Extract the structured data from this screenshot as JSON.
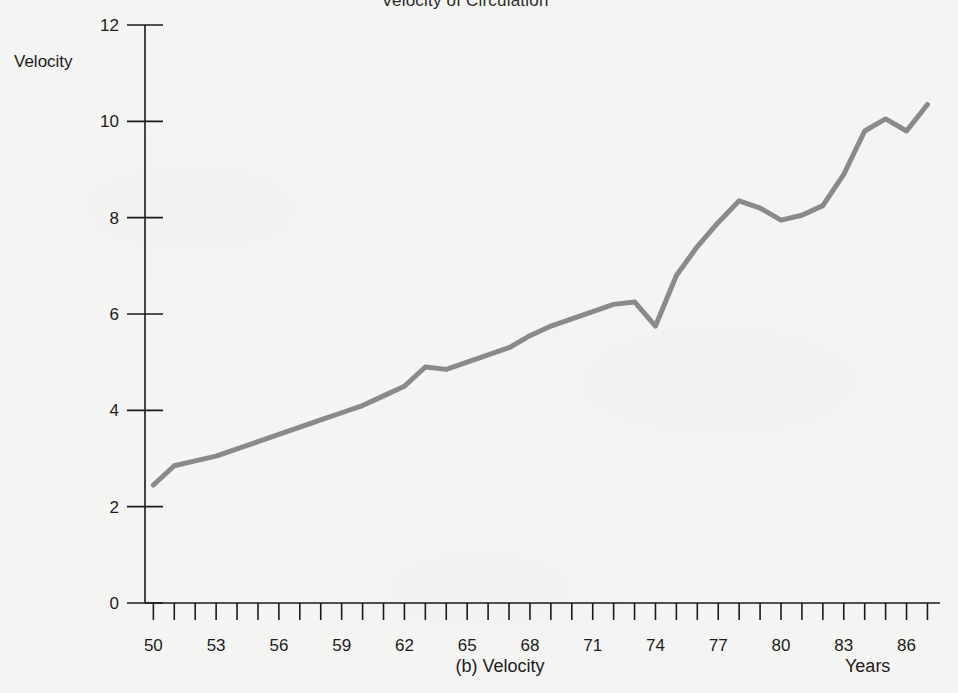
{
  "page": {
    "background_color": "#f4f4f2",
    "title": "Velocity of Circulation",
    "caption": "(b) Velocity",
    "y_axis_title": "Velocity",
    "x_axis_title": "Years"
  },
  "chart_data": {
    "type": "line",
    "title": "Velocity of Circulation",
    "subtitle": "(b) Velocity",
    "xlabel": "Years",
    "ylabel": "Velocity",
    "xlim": [
      49.6,
      87.6
    ],
    "ylim": [
      0,
      12
    ],
    "yticks": [
      0,
      2,
      4,
      6,
      8,
      10,
      12
    ],
    "ytick_labels": [
      "0",
      "2",
      "4",
      "6",
      "8",
      "10",
      "12"
    ],
    "xticks": [
      50,
      51,
      52,
      53,
      54,
      55,
      56,
      57,
      58,
      59,
      60,
      61,
      62,
      63,
      64,
      65,
      66,
      67,
      68,
      69,
      70,
      71,
      72,
      73,
      74,
      75,
      76,
      77,
      78,
      79,
      80,
      81,
      82,
      83,
      84,
      85,
      86,
      87
    ],
    "xtick_labels_shown": [
      "50",
      "53",
      "56",
      "59",
      "62",
      "65",
      "68",
      "71",
      "74",
      "77",
      "80",
      "83",
      "86"
    ],
    "xtick_label_interval": 3,
    "grid": false,
    "legend": null,
    "series": [
      {
        "name": "Velocity of circulation",
        "color": "#8a8a8a",
        "line_width": 5,
        "x": [
          50,
          51,
          52,
          53,
          54,
          55,
          56,
          57,
          58,
          59,
          60,
          61,
          62,
          63,
          64,
          65,
          66,
          67,
          68,
          69,
          70,
          71,
          72,
          73,
          74,
          75,
          76,
          77,
          78,
          79,
          80,
          81,
          82,
          83,
          84,
          85,
          86,
          87
        ],
        "values": [
          2.45,
          2.85,
          2.95,
          3.05,
          3.2,
          3.35,
          3.5,
          3.65,
          3.8,
          3.95,
          4.1,
          4.3,
          4.5,
          4.9,
          4.85,
          5.0,
          5.15,
          5.3,
          5.55,
          5.75,
          5.9,
          6.05,
          6.2,
          6.25,
          5.75,
          6.8,
          7.4,
          7.9,
          8.35,
          8.2,
          7.95,
          8.05,
          8.25,
          8.9,
          9.8,
          10.05,
          9.8,
          10.35
        ]
      }
    ]
  },
  "geometry": {
    "plot_left_px": 145,
    "plot_right_px": 940,
    "plot_top_px": 25,
    "plot_bottom_px": 603,
    "x_origin_year": 49.6,
    "x_end_year": 87.4
  }
}
